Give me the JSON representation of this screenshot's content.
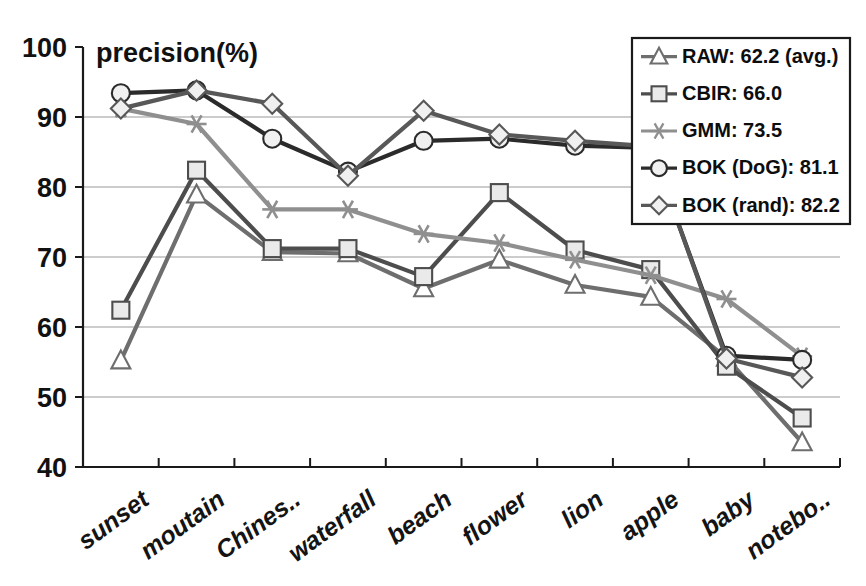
{
  "chart_data": {
    "type": "line",
    "title": "",
    "ylabel": "precision(%)",
    "xlabel": "",
    "ylim": [
      40,
      100
    ],
    "yticks": [
      40,
      50,
      60,
      70,
      80,
      90,
      100
    ],
    "grid": true,
    "legend_position": "top-right",
    "categories": [
      "sunset",
      "moutain",
      "Chines..",
      "waterfall",
      "beach",
      "flower",
      "lion",
      "apple",
      "baby",
      "notebo.."
    ],
    "series": [
      {
        "name": "RAW",
        "legend_label": "RAW: 62.2 (avg.)",
        "average": 62.2,
        "marker": "triangle",
        "color": "#6e6e6e",
        "values": [
          55.2,
          78.9,
          70.7,
          70.5,
          65.5,
          69.6,
          66.0,
          64.3,
          55.6,
          43.5
        ]
      },
      {
        "name": "CBIR",
        "legend_label": "CBIR: 66.0",
        "average": 66.0,
        "marker": "square",
        "color": "#4d4d4d",
        "values": [
          62.4,
          82.4,
          71.2,
          71.2,
          67.2,
          79.2,
          71.0,
          68.2,
          54.4,
          47.0
        ]
      },
      {
        "name": "GMM",
        "legend_label": "GMM: 73.5",
        "average": 73.5,
        "marker": "star",
        "color": "#8f8f8f",
        "values": [
          91.2,
          89.0,
          76.8,
          76.8,
          73.3,
          72.0,
          69.6,
          67.4,
          64.0,
          55.8
        ]
      },
      {
        "name": "BOK (DoG)",
        "legend_label": "BOK (DoG): 81.1",
        "average": 81.1,
        "marker": "circle",
        "color": "#2b2b2b",
        "values": [
          93.4,
          93.8,
          86.9,
          82.2,
          86.6,
          86.9,
          85.9,
          85.6,
          55.9,
          55.3
        ]
      },
      {
        "name": "BOK (rand)",
        "legend_label": "BOK (rand): 82.2",
        "average": 82.2,
        "marker": "diamond",
        "color": "#585858",
        "values": [
          91.2,
          93.8,
          91.9,
          81.6,
          90.9,
          87.5,
          86.6,
          85.8,
          55.5,
          52.8
        ]
      }
    ]
  }
}
